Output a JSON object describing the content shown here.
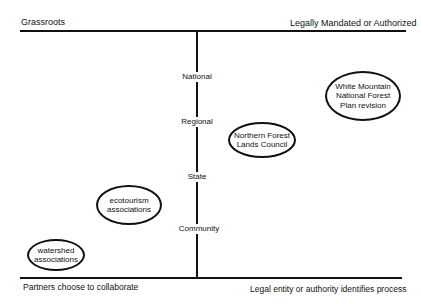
{
  "diagram": {
    "top_axis": {
      "left_label": "Grassroots",
      "right_label": "Legally Mandated or Authorized"
    },
    "bottom_axis": {
      "left_label": "Partners choose to collaborate",
      "right_label": "Legal entity or authority identifies process"
    },
    "vertical_axis": {
      "levels": [
        "National",
        "Regional",
        "State",
        "Community"
      ]
    },
    "nodes": [
      {
        "id": "white-mountain",
        "lines": [
          "White Mountain",
          "National Forest",
          "Plan revision"
        ]
      },
      {
        "id": "northern-forest",
        "lines": [
          "Northern Forest",
          "Lands Council"
        ]
      },
      {
        "id": "ecotourism",
        "lines": [
          "ecotourism",
          "associations"
        ]
      },
      {
        "id": "watershed",
        "lines": [
          "watershed",
          "associations"
        ]
      }
    ]
  }
}
